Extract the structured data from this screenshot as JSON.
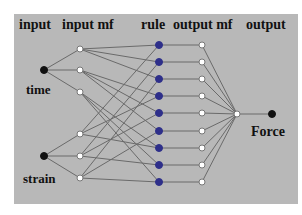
{
  "diagram": {
    "headers": {
      "input": "input",
      "input_mf": "input mf",
      "rule": "rule",
      "output_mf": "output mf",
      "output": "output"
    },
    "inputs": [
      {
        "label": "time",
        "x": 44,
        "y": 70
      },
      {
        "label": "strain",
        "x": 44,
        "y": 156
      }
    ],
    "output_label": "Force",
    "layers": {
      "input_mf": {
        "x": 80,
        "ys": [
          49,
          70,
          92,
          134,
          156,
          178
        ]
      },
      "rule": {
        "x": 159,
        "ys": [
          45,
          62,
          79,
          96,
          113,
          131,
          148,
          165,
          182
        ]
      },
      "output_mf": {
        "x": 202,
        "ys": [
          45,
          62,
          79,
          96,
          113,
          131,
          148,
          165,
          182
        ]
      },
      "output": {
        "x": 237,
        "y": 114
      },
      "force_node": {
        "x": 272,
        "y": 114
      }
    },
    "colors": {
      "background": "#b8b8b8",
      "edge": "#6a6a6a",
      "rule_node": "#2e2f8a",
      "input_node": "#111111",
      "mf_node_fill": "#ffffff"
    }
  }
}
